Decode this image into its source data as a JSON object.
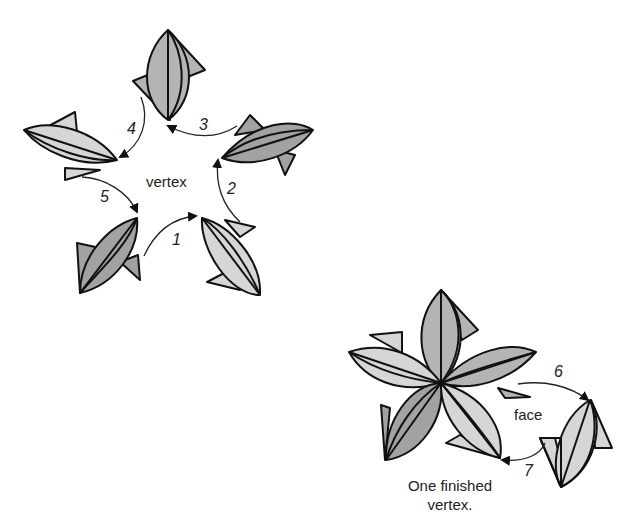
{
  "colors": {
    "light": "#d6d6d6",
    "medium": "#b4b4b4",
    "dark": "#a2a2a2",
    "stroke": "#111111",
    "background": "#ffffff"
  },
  "left_figure": {
    "center_label": "vertex",
    "step_numbers": [
      "1",
      "2",
      "3",
      "4",
      "5"
    ],
    "units": [
      {
        "position": "top",
        "shade": "medium"
      },
      {
        "position": "upper-right",
        "shade": "dark"
      },
      {
        "position": "lower-right",
        "shade": "light"
      },
      {
        "position": "lower-left",
        "shade": "dark"
      },
      {
        "position": "upper-left",
        "shade": "light"
      }
    ]
  },
  "right_figure": {
    "face_label": "face",
    "step_numbers": [
      "6",
      "7"
    ],
    "caption_line1": "One finished",
    "caption_line2": "vertex."
  }
}
